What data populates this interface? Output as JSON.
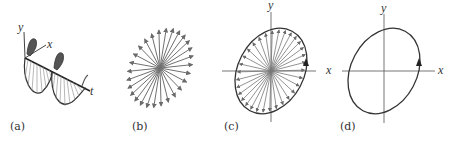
{
  "figure": {
    "panels": [
      {
        "id": "a",
        "caption": "(a)",
        "axis_labels": {
          "y": "y",
          "x": "x",
          "t": "t"
        },
        "description": "rotating field vector tracing a helix along t axis"
      },
      {
        "id": "b",
        "caption": "(b)",
        "description": "field vectors from origin at many instants"
      },
      {
        "id": "c",
        "caption": "(c)",
        "axis_labels": {
          "y": "y",
          "x": "x"
        },
        "description": "vector tips tracing tilted ellipse"
      },
      {
        "id": "d",
        "caption": "(d)",
        "axis_labels": {
          "y": "y",
          "x": "x"
        },
        "description": "polarization ellipse with direction arrow"
      }
    ],
    "colors": {
      "line": "#333333",
      "vector": "#777777",
      "fill": "#555555"
    }
  }
}
